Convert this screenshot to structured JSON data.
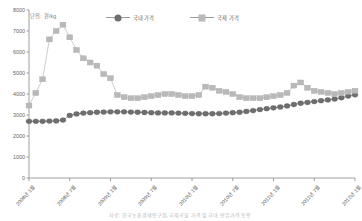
{
  "unit_note": "단위: 원/kg",
  "legend": {
    "items": [
      {
        "label": "국내 가격",
        "marker": "circle-marker",
        "color": "#6e6e6e"
      },
      {
        "label": "국제 가격",
        "marker": "square-marker",
        "color": "#b9b9b9"
      }
    ]
  },
  "caption": "자료: 한국농촌경제연구원, 국제곡물 가격 및 국내 반입가격 동향",
  "chart_data": {
    "type": "line",
    "title": "",
    "subtitle": "",
    "xlabel": "",
    "ylabel": "",
    "unit": "원/kg",
    "ylim": [
      0,
      8000
    ],
    "ytick_values": [
      0,
      1000,
      2000,
      3000,
      4000,
      5000,
      6000,
      7000,
      8000
    ],
    "ytick_labels": [
      "0",
      "1000",
      "2000",
      "3000",
      "4000",
      "5000",
      "6000",
      "7000",
      "8000"
    ],
    "grid": false,
    "legend_position": "top-center",
    "x_major_labels": [
      "2008년 1월",
      "2008년 7월",
      "2009년 1월",
      "2009년 7월",
      "2010년 1월",
      "2010년 7월",
      "2011년 1월",
      "2011년 7월",
      "2012년 1월"
    ],
    "x_major_indices": [
      0,
      6,
      12,
      18,
      24,
      30,
      36,
      42,
      48
    ],
    "x": [
      "2008-01",
      "2008-02",
      "2008-03",
      "2008-04",
      "2008-05",
      "2008-06",
      "2008-07",
      "2008-08",
      "2008-09",
      "2008-10",
      "2008-11",
      "2008-12",
      "2009-01",
      "2009-02",
      "2009-03",
      "2009-04",
      "2009-05",
      "2009-06",
      "2009-07",
      "2009-08",
      "2009-09",
      "2009-10",
      "2009-11",
      "2009-12",
      "2010-01",
      "2010-02",
      "2010-03",
      "2010-04",
      "2010-05",
      "2010-06",
      "2010-07",
      "2010-08",
      "2010-09",
      "2010-10",
      "2010-11",
      "2010-12",
      "2011-01",
      "2011-02",
      "2011-03",
      "2011-04",
      "2011-05",
      "2011-06",
      "2011-07",
      "2011-08",
      "2011-09",
      "2011-10",
      "2011-11",
      "2011-12",
      "2012-01"
    ],
    "series": [
      {
        "name": "국내 가격",
        "marker": "circle",
        "color": "#6e6e6e",
        "values": [
          2700,
          2700,
          2700,
          2710,
          2720,
          2760,
          2980,
          3050,
          3090,
          3110,
          3130,
          3140,
          3150,
          3150,
          3150,
          3140,
          3130,
          3120,
          3110,
          3100,
          3100,
          3100,
          3090,
          3080,
          3070,
          3060,
          3060,
          3060,
          3070,
          3090,
          3110,
          3130,
          3170,
          3210,
          3260,
          3300,
          3340,
          3380,
          3430,
          3500,
          3560,
          3600,
          3640,
          3680,
          3720,
          3760,
          3820,
          3900,
          3960
        ]
      },
      {
        "name": "국제 가격",
        "marker": "square",
        "color": "#b9b9b9",
        "values": [
          3450,
          4050,
          4700,
          6600,
          7000,
          7300,
          6700,
          6100,
          5700,
          5500,
          5350,
          4950,
          4750,
          3950,
          3850,
          3800,
          3800,
          3850,
          3900,
          3950,
          4000,
          4000,
          3950,
          3900,
          3900,
          3950,
          4350,
          4300,
          4150,
          4100,
          4000,
          3850,
          3800,
          3800,
          3800,
          3850,
          3900,
          3950,
          4050,
          4400,
          4550,
          4300,
          4150,
          4100,
          4050,
          4000,
          4050,
          4100,
          4150
        ]
      }
    ]
  }
}
